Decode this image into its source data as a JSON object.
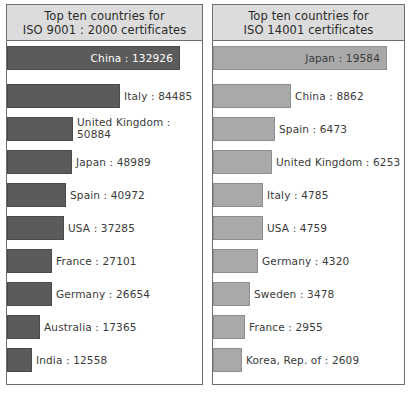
{
  "chart_data": [
    {
      "type": "bar",
      "id": "iso-9001",
      "title": "Top ten countries for ISO 9001 : 2000 certificates",
      "title_lines": [
        "Top ten countries for",
        "ISO 9001 : 2000 certificates"
      ],
      "orientation": "horizontal",
      "xlabel": "",
      "ylabel": "",
      "grid": false,
      "legend": "none",
      "bar_color": "#5b5b5b",
      "categories": [
        "China",
        "Italy",
        "United Kingdom",
        "Japan",
        "Spain",
        "USA",
        "France",
        "Germany",
        "Australia",
        "India"
      ],
      "values": [
        132926,
        84485,
        50884,
        48989,
        40972,
        37285,
        27101,
        26654,
        17365,
        12558
      ],
      "bars": [
        {
          "label": "China : 132926",
          "country": "China",
          "value": 132926,
          "bar_px": 173,
          "label_inside": true
        },
        {
          "label": "Italy : 84485",
          "country": "Italy",
          "value": 84485,
          "bar_px": 113,
          "label_inside": false
        },
        {
          "label": "United Kingdom :\n50884",
          "country": "United Kingdom",
          "value": 50884,
          "bar_px": 66,
          "label_inside": false,
          "two_line": true
        },
        {
          "label": "Japan : 48989",
          "country": "Japan",
          "value": 48989,
          "bar_px": 65,
          "label_inside": false
        },
        {
          "label": "Spain : 40972",
          "country": "Spain",
          "value": 40972,
          "bar_px": 59,
          "label_inside": false
        },
        {
          "label": "USA : 37285",
          "country": "USA",
          "value": 37285,
          "bar_px": 57,
          "label_inside": false
        },
        {
          "label": "France : 27101",
          "country": "France",
          "value": 27101,
          "bar_px": 45,
          "label_inside": false
        },
        {
          "label": "Germany : 26654",
          "country": "Germany",
          "value": 26654,
          "bar_px": 45,
          "label_inside": false
        },
        {
          "label": "Australia : 17365",
          "country": "Australia",
          "value": 17365,
          "bar_px": 33,
          "label_inside": false
        },
        {
          "label": "India : 12558",
          "country": "India",
          "value": 12558,
          "bar_px": 25,
          "label_inside": false
        }
      ]
    },
    {
      "type": "bar",
      "id": "iso-14001",
      "title": "Top ten countries for ISO 14001 certificates",
      "title_lines": [
        "Top ten countries for",
        "ISO 14001 certificates"
      ],
      "orientation": "horizontal",
      "xlabel": "",
      "ylabel": "",
      "grid": false,
      "legend": "none",
      "bar_color": "#a9a9a9",
      "categories": [
        "Japan",
        "China",
        "Spain",
        "United Kingdom",
        "Italy",
        "USA",
        "Germany",
        "Sweden",
        "France",
        "Korea, Rep. of"
      ],
      "values": [
        19584,
        8862,
        6473,
        6253,
        4785,
        4759,
        4320,
        3478,
        2955,
        2609
      ],
      "bars": [
        {
          "label": "Japan : 19584",
          "country": "Japan",
          "value": 19584,
          "bar_px": 174,
          "label_inside": true
        },
        {
          "label": "China : 8862",
          "country": "China",
          "value": 8862,
          "bar_px": 78,
          "label_inside": false
        },
        {
          "label": "Spain : 6473",
          "country": "Spain",
          "value": 6473,
          "bar_px": 62,
          "label_inside": false
        },
        {
          "label": "United Kingdom : 6253",
          "country": "United Kingdom",
          "value": 6253,
          "bar_px": 59,
          "label_inside": false
        },
        {
          "label": "Italy : 4785",
          "country": "Italy",
          "value": 4785,
          "bar_px": 50,
          "label_inside": false
        },
        {
          "label": "USA : 4759",
          "country": "USA",
          "value": 4759,
          "bar_px": 50,
          "label_inside": false
        },
        {
          "label": "Germany : 4320",
          "country": "Germany",
          "value": 4320,
          "bar_px": 45,
          "label_inside": false
        },
        {
          "label": "Sweden : 3478",
          "country": "Sweden",
          "value": 3478,
          "bar_px": 37,
          "label_inside": false
        },
        {
          "label": "France : 2955",
          "country": "France",
          "value": 2955,
          "bar_px": 32,
          "label_inside": false
        },
        {
          "label": "Korea, Rep. of : 2609",
          "country": "Korea, Rep. of",
          "value": 2609,
          "bar_px": 29,
          "label_inside": false
        }
      ]
    }
  ],
  "colors": {
    "panel_border": "#6e6e6e",
    "header_bg": "#dcdcdc",
    "bar_dark": "#5b5b5b",
    "bar_light": "#a9a9a9",
    "text": "#3a3a3a",
    "background": "#ffffff"
  }
}
